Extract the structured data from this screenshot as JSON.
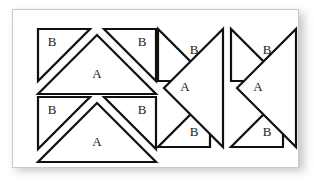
{
  "figure": {
    "background_color": "#ffffff",
    "panel_color": "#ffffff",
    "panel_border_color": "#c9c9c9",
    "stroke_color": "#101010",
    "label_color": "#1a1a1a",
    "shadow_color": "#9a9a9a"
  },
  "groups": [
    {
      "id": "group-top-left",
      "orientation": "apex-up",
      "shapes": [
        {
          "name": "b-triangle-left",
          "label": "B",
          "points": "6,6 58,6 6,58",
          "label_x": 20,
          "label_y": 20
        },
        {
          "name": "b-triangle-right",
          "label": "B",
          "points": "124,6 124,58 72,6",
          "label_x": 110,
          "label_y": 20
        },
        {
          "name": "a-triangle",
          "label": "A",
          "points": "65,12 124,71 6,71",
          "label_x": 65,
          "label_y": 52
        }
      ]
    },
    {
      "id": "group-bottom-left",
      "orientation": "apex-up",
      "shapes": [
        {
          "name": "b-triangle-left",
          "label": "B",
          "points": "6,6 58,6 6,58",
          "label_x": 20,
          "label_y": 20
        },
        {
          "name": "b-triangle-right",
          "label": "B",
          "points": "124,6 124,58 72,6",
          "label_x": 110,
          "label_y": 20
        },
        {
          "name": "a-triangle",
          "label": "A",
          "points": "65,12 124,71 6,71",
          "label_x": 65,
          "label_y": 52
        }
      ]
    },
    {
      "id": "group-middle",
      "orientation": "apex-right",
      "shapes": [
        {
          "name": "b-triangle-top",
          "label": "B",
          "points": "6,6 6,58 58,58",
          "label_x": 42,
          "label_y": 28
        },
        {
          "name": "b-triangle-bottom",
          "label": "B",
          "points": "6,124 58,124 58,72",
          "label_x": 42,
          "label_y": 110
        },
        {
          "name": "a-triangle",
          "label": "A",
          "points": "12,65 71,6 71,124",
          "label_x": 33,
          "label_y": 65
        }
      ]
    },
    {
      "id": "group-right",
      "orientation": "apex-right",
      "shapes": [
        {
          "name": "b-triangle-top",
          "label": "B",
          "points": "6,6 6,58 58,58",
          "label_x": 42,
          "label_y": 28
        },
        {
          "name": "b-triangle-bottom",
          "label": "B",
          "points": "6,124 58,124 58,72",
          "label_x": 42,
          "label_y": 110
        },
        {
          "name": "a-triangle",
          "label": "A",
          "points": "12,65 71,6 71,124",
          "label_x": 33,
          "label_y": 65
        }
      ]
    }
  ],
  "group_transforms": {
    "group-top-left": "translate(20, 14)",
    "group-bottom-left": "translate(20, 82)",
    "group-middle": "translate(140, 14)",
    "group-right": "translate(213, 14)"
  }
}
